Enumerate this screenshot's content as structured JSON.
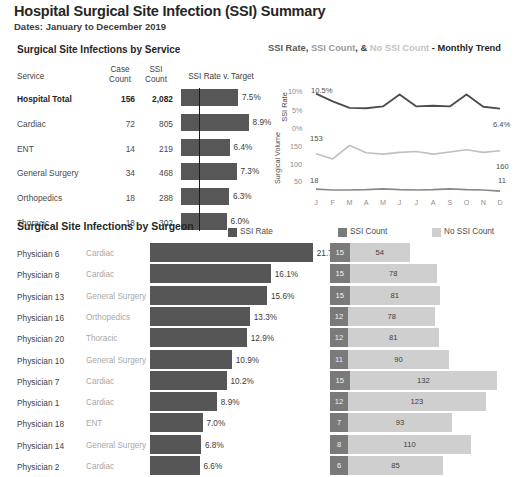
{
  "header": {
    "title": "Hospital Surgical Site Infection (SSI) Summary",
    "subtitle": "Dates: January to December 2019"
  },
  "service_section": {
    "heading": "Surgical Site Infections by Service",
    "columns": {
      "service": "Service",
      "case_count_line1": "Case",
      "case_count_line2": "Count",
      "ssi_count_line1": "SSI",
      "ssi_count_line2": "Count",
      "rate": "SSI Rate v. Target"
    },
    "rows": [
      {
        "service": "Hospital Total",
        "case_count": "156",
        "ssi_count": "2,082",
        "rate_label": "7.5%",
        "rate": 7.5,
        "total": true
      },
      {
        "service": "Cardiac",
        "case_count": "72",
        "ssi_count": "805",
        "rate_label": "8.9%",
        "rate": 8.9,
        "total": false
      },
      {
        "service": "ENT",
        "case_count": "14",
        "ssi_count": "219",
        "rate_label": "6.4%",
        "rate": 6.4,
        "total": false
      },
      {
        "service": "General Surgery",
        "case_count": "34",
        "ssi_count": "468",
        "rate_label": "7.3%",
        "rate": 7.3,
        "total": false
      },
      {
        "service": "Orthopedics",
        "case_count": "18",
        "ssi_count": "288",
        "rate_label": "6.3%",
        "rate": 6.3,
        "total": false
      },
      {
        "service": "Thoracic",
        "case_count": "18",
        "ssi_count": "302",
        "rate_label": "6.0%",
        "rate": 6.0,
        "total": false
      }
    ],
    "target_value": 5.0
  },
  "trend_section": {
    "title_parts": {
      "rate": "SSI Rate",
      "sep1": ", ",
      "count": "SSI Count",
      "sep2": ", ",
      "amp": "& ",
      "no_count": "No SSI Count",
      "tail": " - Monthly Trend"
    }
  },
  "surgeon_section": {
    "heading": "Surgical Site Infections by Surgeon",
    "legend": [
      {
        "label": "SSI Rate",
        "color": "#565656"
      },
      {
        "label": "SSI Count",
        "color": "#7a7a7a"
      },
      {
        "label": "No SSI Count",
        "color": "#cfcfcf"
      }
    ],
    "rows": [
      {
        "name": "Physician 6",
        "service": "Cardiac",
        "rate_label": "21.7%",
        "rate": 21.7,
        "ssi_count": "15",
        "no_ssi_count": "54"
      },
      {
        "name": "Physician 8",
        "service": "Cardiac",
        "rate_label": "16.1%",
        "rate": 16.1,
        "ssi_count": "15",
        "no_ssi_count": "78"
      },
      {
        "name": "Physician 13",
        "service": "General Surgery",
        "rate_label": "15.6%",
        "rate": 15.6,
        "ssi_count": "15",
        "no_ssi_count": "81"
      },
      {
        "name": "Physician 16",
        "service": "Orthopedics",
        "rate_label": "13.3%",
        "rate": 13.3,
        "ssi_count": "12",
        "no_ssi_count": "78"
      },
      {
        "name": "Physician 20",
        "service": "Thoracic",
        "rate_label": "12.9%",
        "rate": 12.9,
        "ssi_count": "12",
        "no_ssi_count": "81"
      },
      {
        "name": "Physician 10",
        "service": "General Surgery",
        "rate_label": "10.9%",
        "rate": 10.9,
        "ssi_count": "11",
        "no_ssi_count": "90"
      },
      {
        "name": "Physician 7",
        "service": "Cardiac",
        "rate_label": "10.2%",
        "rate": 10.2,
        "ssi_count": "15",
        "no_ssi_count": "132"
      },
      {
        "name": "Physician 1",
        "service": "Cardiac",
        "rate_label": "8.9%",
        "rate": 8.9,
        "ssi_count": "12",
        "no_ssi_count": "123"
      },
      {
        "name": "Physician 18",
        "service": "ENT",
        "rate_label": "7.0%",
        "rate": 7.0,
        "ssi_count": "7",
        "no_ssi_count": "93"
      },
      {
        "name": "Physician 14",
        "service": "General Surgery",
        "rate_label": "6.8%",
        "rate": 6.8,
        "ssi_count": "8",
        "no_ssi_count": "110"
      },
      {
        "name": "Physician 2",
        "service": "Cardiac",
        "rate_label": "6.6%",
        "rate": 6.6,
        "ssi_count": "6",
        "no_ssi_count": "85"
      }
    ]
  },
  "chart_data": [
    {
      "type": "bar",
      "title": "SSI Rate v. Target",
      "categories": [
        "Hospital Total",
        "Cardiac",
        "ENT",
        "General Surgery",
        "Orthopedics",
        "Thoracic"
      ],
      "values": [
        7.5,
        8.9,
        6.4,
        7.3,
        6.3,
        6.0
      ],
      "target": 5.0,
      "xlabel": "SSI Rate",
      "ylabel": "",
      "xlim": [
        0,
        10
      ],
      "grid": false,
      "legend": false
    },
    {
      "type": "line",
      "title": "SSI Rate, SSI Count, & No SSI Count - Monthly Trend",
      "x": [
        "J",
        "F",
        "M",
        "A",
        "M",
        "J",
        "J",
        "A",
        "S",
        "O",
        "N",
        "D"
      ],
      "series": [
        {
          "name": "SSI Rate",
          "ylabel": "SSI Rate",
          "values": [
            10.5,
            8.4,
            6.6,
            6.5,
            7.0,
            10.3,
            7.0,
            7.2,
            7.0,
            10.3,
            6.9,
            6.4
          ],
          "ylim": [
            0,
            11
          ],
          "yticks": [
            "0%",
            "5%",
            "10%"
          ],
          "first_label": "10.5%",
          "last_label": "6.4%",
          "color": "#4d4d4d"
        },
        {
          "name": "Surgical Volume",
          "ylabel": "Surgical Volume",
          "values": [
            153,
            141,
            172,
            155,
            152,
            156,
            158,
            152,
            157,
            162,
            156,
            160
          ],
          "ylim": [
            50,
            190
          ],
          "yticks": [
            "50",
            "100",
            "150"
          ],
          "first_label": "153",
          "last_label": "160",
          "color": "#c0c0c0"
        },
        {
          "name": "SSI Count",
          "values": [
            18,
            15,
            15,
            16,
            19,
            16,
            15,
            16,
            19,
            16,
            15,
            11
          ],
          "first_label": "18",
          "last_label": "11",
          "color": "#8a8a8a"
        }
      ],
      "grid": false,
      "legend_position": "title"
    },
    {
      "type": "bar",
      "title": "Surgical Site Infections by Surgeon",
      "categories": [
        "Physician 6",
        "Physician 8",
        "Physician 13",
        "Physician 16",
        "Physician 20",
        "Physician 10",
        "Physician 7",
        "Physician 1",
        "Physician 18",
        "Physician 14",
        "Physician 2"
      ],
      "series": [
        {
          "name": "SSI Rate",
          "values": [
            21.7,
            16.1,
            15.6,
            13.3,
            12.9,
            10.9,
            10.2,
            8.9,
            7.0,
            6.8,
            6.6
          ],
          "color": "#565656"
        },
        {
          "name": "SSI Count",
          "values": [
            15,
            15,
            15,
            12,
            12,
            11,
            15,
            12,
            7,
            8,
            6
          ],
          "color": "#7a7a7a"
        },
        {
          "name": "No SSI Count",
          "values": [
            54,
            78,
            81,
            78,
            81,
            90,
            132,
            123,
            93,
            110,
            85
          ],
          "color": "#cfcfcf"
        }
      ],
      "xlabel": "",
      "ylabel": "",
      "grid": false,
      "legend_position": "top-right"
    }
  ]
}
